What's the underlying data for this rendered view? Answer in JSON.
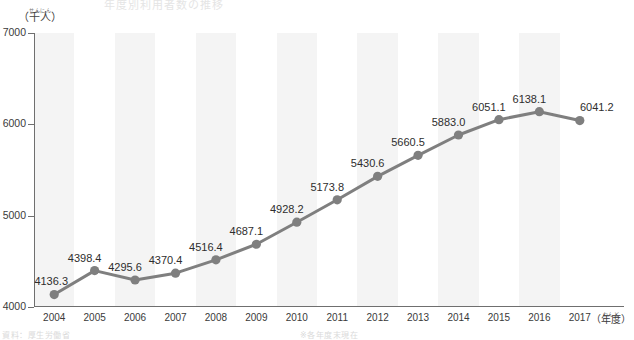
{
  "meta": {
    "top_title_fragment": "年度別利用者数の推移",
    "bottom_note_fragment": "資料：厚生労働省",
    "bottom_note_fragment_2": "※各年度末現在"
  },
  "axes": {
    "y_unit_ruby": "せんにん",
    "y_unit": "（千人）",
    "x_unit_ruby": "ねんど",
    "x_unit": "（年度）"
  },
  "chart_data": {
    "type": "line",
    "title": "年度別利用者数の推移",
    "xlabel": "（年度）",
    "ylabel": "（千人）",
    "ylim": [
      4000,
      7000
    ],
    "yticks": [
      4000,
      5000,
      6000,
      7000
    ],
    "ytick_labels": [
      "4000",
      "5000",
      "6000",
      "7000"
    ],
    "grid": false,
    "legend": "none",
    "banding": "alternating vertical gray/white stripes, one per category",
    "line_color": "#7f7f7f",
    "marker_color": "#7f7f7f",
    "band_color": "#f4f4f4",
    "categories": [
      "2004",
      "2005",
      "2006",
      "2007",
      "2008",
      "2009",
      "2010",
      "2011",
      "2012",
      "2013",
      "2014",
      "2015",
      "2016",
      "2017"
    ],
    "values": [
      4136.3,
      4398.4,
      4295.6,
      4370.4,
      4516.4,
      4687.1,
      4928.2,
      5173.8,
      5430.6,
      5660.5,
      5883.0,
      6051.1,
      6138.1,
      6041.2
    ],
    "data_labels": [
      "4136.3",
      "4398.4",
      "4295.6",
      "4370.4",
      "4516.4",
      "4687.1",
      "4928.2",
      "5173.8",
      "5430.6",
      "5660.5",
      "5883.0",
      "6051.1",
      "6138.1",
      "6041.2"
    ]
  }
}
